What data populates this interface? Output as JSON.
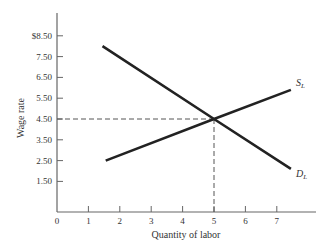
{
  "chart_data": {
    "type": "line",
    "title": "",
    "xlabel": "Quantity of labor",
    "ylabel": "Wage rate",
    "xlim": [
      0,
      8.2
    ],
    "ylim": [
      0,
      9.5
    ],
    "x_ticks": [
      "0",
      "1",
      "2",
      "3",
      "4",
      "5",
      "6",
      "7"
    ],
    "x_tick_values": [
      0,
      1,
      2,
      3,
      4,
      5,
      6,
      7
    ],
    "y_ticks": [
      "$8.50",
      "7.50",
      "6.50",
      "5.50",
      "4.50",
      "3.50",
      "2.50",
      "1.50"
    ],
    "y_tick_values": [
      8.5,
      7.5,
      6.5,
      5.5,
      4.5,
      3.5,
      2.5,
      1.5
    ],
    "grid": false,
    "series": [
      {
        "name": "S_L",
        "label_main": "S",
        "label_sub": "L",
        "description": "Labor supply",
        "x": [
          1.55,
          5,
          7.45
        ],
        "y": [
          2.5,
          4.5,
          5.9
        ],
        "color": "#222222"
      },
      {
        "name": "D_L",
        "label_main": "D",
        "label_sub": "L",
        "description": "Labor demand",
        "x": [
          1.45,
          5,
          7.45
        ],
        "y": [
          8.0,
          4.5,
          2.1
        ],
        "color": "#222222"
      }
    ],
    "annotations": [
      {
        "type": "equilibrium",
        "x": 5,
        "y": 4.5,
        "guides": "dashed lines to both axes"
      }
    ]
  }
}
